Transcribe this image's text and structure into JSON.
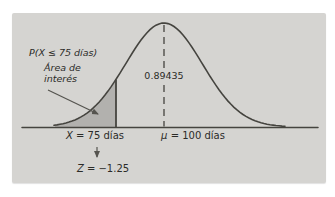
{
  "colors": {
    "page_bg": "#ffffff",
    "panel_bg": "#d5d4d1",
    "shaded_area": "#b2b1ae",
    "line_color": "#45443f",
    "text_color": "#2b2b28"
  },
  "figure": {
    "annotations": {
      "probability_expression": "P(X ≤ 75 días)",
      "area_of_interest_line1": "Área de",
      "area_of_interest_line2": "interés",
      "probability_value": "0.89435"
    },
    "axis_labels": {
      "x_var": "X",
      "x_rest": " = 75 días",
      "mu_var": "μ",
      "mu_rest": " = 100 días",
      "z_var": "Z",
      "z_rest": " = −1.25"
    }
  },
  "chart_data": {
    "type": "area",
    "distribution": "normal",
    "mean": 100,
    "unit": "días",
    "x_value": 75,
    "z_value": -1.25,
    "probability_value": 0.89435,
    "shaded_region": "X ≤ 75 días",
    "annotations": [
      "P(X ≤ 75 días)",
      "Área de interés",
      "0.89435",
      "X = 75 días",
      "μ = 100 días",
      "Z = −1.25"
    ],
    "legend": "none",
    "grid": false
  }
}
